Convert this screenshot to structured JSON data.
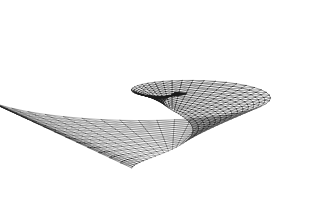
{
  "figure": {
    "title": "3D wireframe mesh surface",
    "surface_type": "parametric-wireframe",
    "background_color": "#ffffff",
    "line_color": "#1a1a1a",
    "line_color_faint": "#555555",
    "line_width": 0.45,
    "canvas": {
      "width": 326,
      "height": 209
    }
  },
  "chart_data": {
    "type": "line",
    "title": "3D wireframe mesh surface",
    "xlabel": "",
    "ylabel": "",
    "grid": false,
    "legend": null,
    "xlim": [
      0,
      326
    ],
    "ylim": [
      0,
      209
    ],
    "surface": {
      "name": "spiral-ramp-funnel",
      "u_divisions": 64,
      "v_divisions": 14,
      "u_range_deg": [
        0,
        520
      ],
      "v_range": [
        0.06,
        1.0
      ],
      "triangulated": true,
      "diagonals": "forward"
    },
    "projection": {
      "type": "oblique-perspective",
      "center_x": 172,
      "center_y": 92,
      "scale_x": 148,
      "scale_y": 96,
      "tilt": 0.3,
      "cusp_point": [
        172,
        10
      ]
    },
    "regions": [
      {
        "name": "left-disc",
        "bbox": [
          14,
          14,
          170,
          105
        ],
        "ring_count": 9,
        "spoke_count": 14,
        "density": "converging-to-center"
      },
      {
        "name": "dense-core",
        "bbox": [
          84,
          34,
          140,
          62
        ],
        "density": "very-high"
      },
      {
        "name": "fold-cusp",
        "bbox": [
          150,
          8,
          195,
          48
        ],
        "density": "high"
      },
      {
        "name": "neck-silhouette",
        "bbox": [
          160,
          70,
          186,
          150
        ],
        "density": "high"
      },
      {
        "name": "right-funnel",
        "bbox": [
          176,
          12,
          314,
          198
        ],
        "ring_count": 18,
        "density": "radiating-fan"
      }
    ]
  }
}
